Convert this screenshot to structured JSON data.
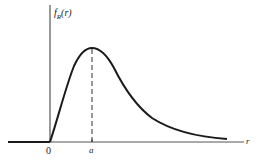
{
  "figure": {
    "type": "probability-density-curve",
    "y_axis_label": {
      "main": "f",
      "sub": "R",
      "arg": "(r)"
    },
    "x_axis_label": "r",
    "tick_labels": {
      "origin": "0",
      "mode": "a"
    },
    "colors": {
      "curve": "#1a1a1a",
      "axes": "#333333",
      "dashed": "#333333",
      "background": "#ffffff"
    }
  }
}
